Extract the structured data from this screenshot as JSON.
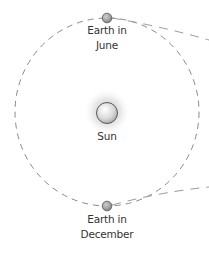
{
  "diagram": {
    "colors": {
      "background": "#ffffff",
      "orbit": "#8a8a8a",
      "planet_fill": "#9a9a9a",
      "planet_stroke": "#555555",
      "sun_fill": "#d8d8d8",
      "sun_stroke": "#4a4a4a",
      "sun_glow": "#c8c8c8",
      "text": "#333333"
    },
    "orbit": {
      "style": "dashed",
      "shape": "circle"
    },
    "bodies": [
      {
        "name": "Earth in June",
        "label_lines": [
          "Earth in",
          "June"
        ],
        "position": "top of orbit"
      },
      {
        "name": "Sun",
        "label_lines": [
          "Sun"
        ],
        "position": "center"
      },
      {
        "name": "Earth in December",
        "label_lines": [
          "Earth in",
          "December"
        ],
        "position": "bottom of orbit"
      }
    ],
    "sight_lines": [
      {
        "from": "Earth in June",
        "direction": "right",
        "style": "dashed"
      },
      {
        "from": "Earth in December",
        "direction": "right",
        "style": "dashed"
      }
    ]
  }
}
